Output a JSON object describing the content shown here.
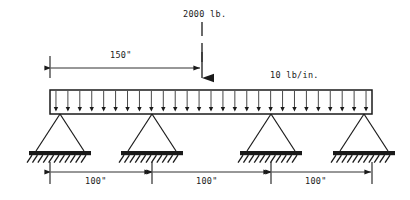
{
  "figure": {
    "background_color": "#ffffff",
    "line_color": "#1a1a1a"
  },
  "loads": {
    "point_load_label": "2000 lb.",
    "point_load_value": 2000,
    "point_load_units": "lb",
    "point_load_position_label": "150\"",
    "point_load_position": 150,
    "distributed_load_label": "10 lb/in.",
    "distributed_load_value": 10,
    "distributed_load_units": "lb/in",
    "distributed_arrow_count": 27
  },
  "dimensions": {
    "span_1_label": "100\"",
    "span_2_label": "100\"",
    "span_3_label": "100\"",
    "span_values": [
      100,
      100,
      100
    ],
    "total_length": 300,
    "units": "in"
  },
  "supports": {
    "count": 4,
    "type": "pin",
    "positions": [
      0,
      100,
      200,
      300
    ]
  },
  "chart_data": {
    "type": "diagram",
    "beam_length": 300,
    "beam_units": "in",
    "supports": [
      {
        "id": "A",
        "x": 0,
        "type": "pin"
      },
      {
        "id": "B",
        "x": 100,
        "type": "pin"
      },
      {
        "id": "C",
        "x": 200,
        "type": "pin"
      },
      {
        "id": "D",
        "x": 300,
        "type": "pin"
      }
    ],
    "point_loads": [
      {
        "magnitude": 2000,
        "units": "lb",
        "x": 150,
        "direction": "down",
        "label": "2000 lb."
      }
    ],
    "distributed_loads": [
      {
        "magnitude": 10,
        "units": "lb/in.",
        "x_start": 0,
        "x_end": 300,
        "direction": "down",
        "label": "10 lb/in."
      }
    ],
    "dimension_lines": [
      {
        "label": "150\"",
        "from": 0,
        "to": 150,
        "placement": "above"
      },
      {
        "label": "100\"",
        "from": 0,
        "to": 100,
        "placement": "below"
      },
      {
        "label": "100\"",
        "from": 100,
        "to": 200,
        "placement": "below"
      },
      {
        "label": "100\"",
        "from": 200,
        "to": 300,
        "placement": "below"
      }
    ]
  }
}
